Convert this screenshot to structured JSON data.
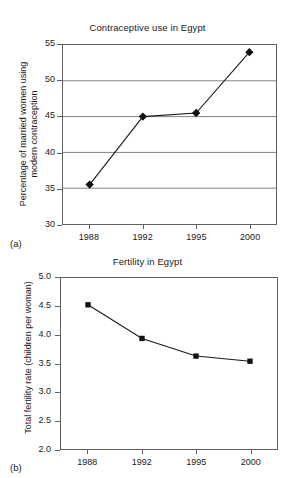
{
  "figure": {
    "panel_a_label": "(a)",
    "panel_b_label": "(b)"
  },
  "chart_data": [
    {
      "type": "line",
      "title": "Contraceptive use in Egypt",
      "xlabel": "",
      "ylabel": "Percentage of married women using\nmodern contraception",
      "categories": [
        "1988",
        "1992",
        "1995",
        "2000"
      ],
      "values": [
        35.5,
        45.0,
        45.5,
        54.0
      ],
      "ylim": [
        30,
        55
      ],
      "yticks": [
        "30",
        "35",
        "40",
        "45",
        "50",
        "55"
      ],
      "ytick_values": [
        30,
        35,
        40,
        45,
        50,
        55
      ],
      "grid": "horizontal",
      "marker": "diamond",
      "legend": "none",
      "line_color": "#1a1a1a",
      "marker_color": "#111111",
      "grid_color": "#808080"
    },
    {
      "type": "line",
      "title": "Fertility in Egypt",
      "xlabel": "",
      "ylabel": "Total fertility rate (children per woman)",
      "categories": [
        "1988",
        "1992",
        "1995",
        "2000"
      ],
      "values": [
        4.53,
        3.94,
        3.63,
        3.54
      ],
      "ylim": [
        2.0,
        5.0
      ],
      "yticks": [
        "2.0",
        "2.5",
        "3.0",
        "3.5",
        "4.0",
        "4.5",
        "5.0"
      ],
      "ytick_values": [
        2.0,
        2.5,
        3.0,
        3.5,
        4.0,
        4.5,
        5.0
      ],
      "grid": "none",
      "marker": "square",
      "legend": "none",
      "line_color": "#1a1a1a",
      "marker_color": "#111111",
      "grid_color": "#808080"
    }
  ]
}
